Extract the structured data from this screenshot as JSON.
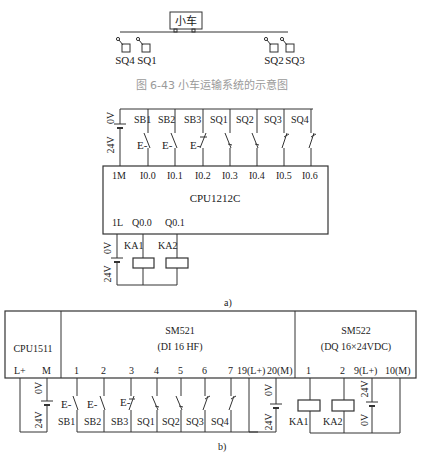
{
  "figure_top": {
    "cart_label": "小车",
    "switches_left": [
      "SQ4",
      "SQ1"
    ],
    "switches_right": [
      "SQ2",
      "SQ3"
    ],
    "caption": "图 6-43   小车运输系统的示意图"
  },
  "figure_a": {
    "supply": {
      "zero": "0V",
      "plus": "24V"
    },
    "input_devices": [
      "SB1",
      "SB2",
      "SB3",
      "SQ1",
      "SQ2",
      "SQ3",
      "SQ4"
    ],
    "input_terminals": [
      "1M",
      "I0.0",
      "I0.1",
      "I0.2",
      "I0.3",
      "I0.4",
      "I0.5",
      "I0.6"
    ],
    "cpu_label": "CPU1212C",
    "output_terminals": [
      "1L",
      "Q0.0",
      "Q0.1"
    ],
    "output_supply": {
      "zero": "0V",
      "plus": "24V"
    },
    "coils": [
      "KA1",
      "KA2"
    ],
    "label": "a)"
  },
  "figure_b": {
    "cpu": {
      "label": "CPU1511",
      "terminals": [
        "L+",
        "M"
      ]
    },
    "sm521": {
      "title": "SM521",
      "subtitle": "(DI 16 HF)",
      "terminals": [
        "1",
        "2",
        "3",
        "4",
        "5",
        "6",
        "7",
        "19(L+)",
        "20(M)"
      ]
    },
    "sm522": {
      "title": "SM522",
      "subtitle": "(DQ 16×24VDC)",
      "terminals": [
        "1",
        "2",
        "9(L+)",
        "10(M)"
      ]
    },
    "supply_cpu": {
      "zero": "0V",
      "plus": "24V"
    },
    "supply_di": {
      "zero": "0V",
      "plus": "24V"
    },
    "supply_dq": {
      "zero": "0V",
      "plus": "24V"
    },
    "input_devices": [
      "SB1",
      "SB2",
      "SB3",
      "SQ1",
      "SQ2",
      "SQ3",
      "SQ4"
    ],
    "coils": [
      "KA1",
      "KA2"
    ],
    "label": "b)"
  }
}
